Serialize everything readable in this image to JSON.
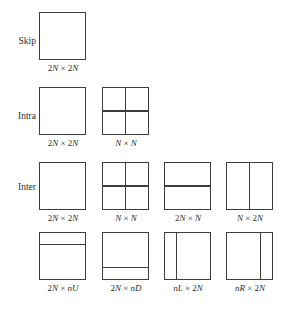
{
  "figure": {
    "border_color": "#3d3d3d",
    "background_color": "#ffffff",
    "text_color": "#2b2b2b",
    "times_symbol": "×"
  },
  "rows": [
    {
      "label": "Skip",
      "cells": [
        {
          "caption_prefix": "2",
          "caption_var1": "N",
          "caption_mid": " × 2",
          "caption_var2": "N",
          "caption_full": "2N × 2N",
          "partition": "none"
        }
      ]
    },
    {
      "label": "Intra",
      "cells": [
        {
          "caption_prefix": "2",
          "caption_var1": "N",
          "caption_mid": " × 2",
          "caption_var2": "N",
          "caption_full": "2N × 2N",
          "partition": "none"
        },
        {
          "caption_prefix": "",
          "caption_var1": "N",
          "caption_mid": " × ",
          "caption_var2": "N",
          "caption_full": "N × N",
          "partition": "quad"
        }
      ]
    },
    {
      "label": "Inter",
      "cells": [
        {
          "caption_prefix": "2",
          "caption_var1": "N",
          "caption_mid": " × 2",
          "caption_var2": "N",
          "caption_full": "2N × 2N",
          "partition": "none"
        },
        {
          "caption_prefix": "",
          "caption_var1": "N",
          "caption_mid": " × ",
          "caption_var2": "N",
          "caption_full": "N × N",
          "partition": "quad"
        },
        {
          "caption_prefix": "2",
          "caption_var1": "N",
          "caption_mid": " × ",
          "caption_var2": "N",
          "caption_full": "2N × N",
          "partition": "horizontal-half"
        },
        {
          "caption_prefix": "",
          "caption_var1": "N",
          "caption_mid": " × 2",
          "caption_var2": "N",
          "caption_full": "N × 2N",
          "partition": "vertical-half"
        }
      ]
    },
    {
      "label": "",
      "cells": [
        {
          "caption_prefix": "2",
          "caption_var1": "N",
          "caption_mid": " × ",
          "caption_var2": "nU",
          "caption_full": "2N × nU",
          "partition": "horizontal-upper-quarter"
        },
        {
          "caption_prefix": "2",
          "caption_var1": "N",
          "caption_mid": " × ",
          "caption_var2": "nD",
          "caption_full": "2N × nD",
          "partition": "horizontal-lower-quarter"
        },
        {
          "caption_prefix": "",
          "caption_var1": "nL",
          "caption_mid": " × 2",
          "caption_var2": "N",
          "caption_full": "nL × 2N",
          "partition": "vertical-left-quarter"
        },
        {
          "caption_prefix": "",
          "caption_var1": "nR",
          "caption_mid": " × 2",
          "caption_var2": "N",
          "caption_full": "nR × 2N",
          "partition": "vertical-right-quarter"
        }
      ]
    }
  ]
}
